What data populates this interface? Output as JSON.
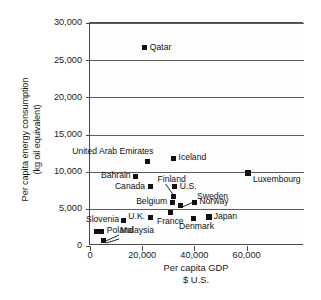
{
  "chart_data": {
    "type": "scatter",
    "title": "",
    "xlabel": "Per capita GDP",
    "xlabel_line2": "$ U.S.",
    "ylabel": "Per capita energy consumption",
    "ylabel_line2": "(kg oil equivalent)",
    "xlim": [
      0,
      82000
    ],
    "ylim": [
      0,
      30000
    ],
    "xticks": [
      0,
      20000,
      40000,
      60000
    ],
    "xtick_labels": [
      "0",
      "20,000",
      "40,000",
      "60,000"
    ],
    "yticks": [
      0,
      5000,
      10000,
      15000,
      20000,
      25000,
      30000
    ],
    "ytick_labels": [
      "0",
      "5,000",
      "10,000",
      "15,000",
      "20,000",
      "25,000",
      "30,000"
    ],
    "grid": "horizontal",
    "legend": "none",
    "points": [
      {
        "name": "Qatar",
        "x": 21000,
        "y": 26700,
        "label": "Qatar",
        "label_pos": "right"
      },
      {
        "name": "United Arab Emirates",
        "x": 22000,
        "y": 11400,
        "label": "United Arab Emirates",
        "label_pos": "above-left"
      },
      {
        "name": "Iceland",
        "x": 32000,
        "y": 11800,
        "label": "Iceland",
        "label_pos": "right"
      },
      {
        "name": "Luxembourg",
        "x": 60500,
        "y": 9800,
        "label": "Luxembourg",
        "label_pos": "below-right"
      },
      {
        "name": "Bahrain",
        "x": 17500,
        "y": 9350,
        "label": "Bahrain",
        "label_pos": "left"
      },
      {
        "name": "Canada",
        "x": 23000,
        "y": 8000,
        "label": "Canada",
        "label_pos": "left"
      },
      {
        "name": "U.S.",
        "x": 32500,
        "y": 8000,
        "label": "U.S.",
        "label_pos": "right"
      },
      {
        "name": "Finland",
        "x": 32000,
        "y": 6600,
        "label": "Finland",
        "label_pos": "leader-above"
      },
      {
        "name": "Sweden",
        "x": 34500,
        "y": 5400,
        "label": "Sweden",
        "label_pos": "leader-right"
      },
      {
        "name": "Belgium",
        "x": 31500,
        "y": 5900,
        "label": "Belgium",
        "label_pos": "left"
      },
      {
        "name": "Norway",
        "x": 40000,
        "y": 5900,
        "label": "Norway",
        "label_pos": "right"
      },
      {
        "name": "France",
        "x": 31000,
        "y": 4500,
        "label": "France",
        "label_pos": "below"
      },
      {
        "name": "U.K.",
        "x": 23000,
        "y": 3900,
        "label": "U.K.",
        "label_pos": "left"
      },
      {
        "name": "Denmark",
        "x": 39500,
        "y": 3700,
        "label": "Denmark",
        "label_pos": "below"
      },
      {
        "name": "Japan",
        "x": 45500,
        "y": 3900,
        "label": "Japan",
        "label_pos": "right"
      },
      {
        "name": "Slovenia",
        "x": 13000,
        "y": 3450,
        "label": "Slovenia",
        "label_pos": "left"
      },
      {
        "name": "Poland",
        "x": 4500,
        "y": 2000,
        "label": "Poland",
        "label_pos": "right"
      },
      {
        "name": "Poland-pair",
        "x": 2600,
        "y": 2000,
        "label": "",
        "label_pos": "none"
      },
      {
        "name": "Malaysia",
        "x": 5000,
        "y": 800,
        "label": "Malaysia",
        "label_pos": "leader-right"
      }
    ]
  }
}
